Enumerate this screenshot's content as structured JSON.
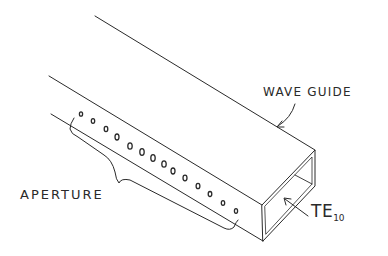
{
  "figure": {
    "type": "hand-drawn isometric sketch"
  },
  "labels": {
    "waveguide": "WAVE GUIDE",
    "aperture": "APERTURE",
    "mode_main": "TE",
    "mode_sub": "10"
  },
  "apertures": {
    "count": 14
  },
  "colors": {
    "ink": "#2a2a2a",
    "background": "#ffffff"
  }
}
